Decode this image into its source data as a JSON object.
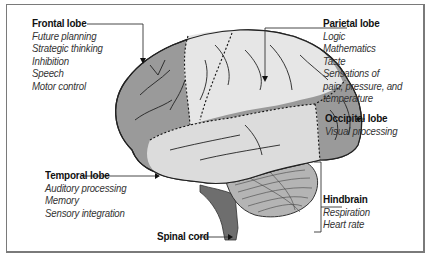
{
  "diagram": {
    "type": "labeled anatomical diagram",
    "regions": [
      {
        "name": "Frontal lobe",
        "functions": [
          "Future planning",
          "Strategic thinking",
          "Inhibition",
          "Speech",
          "Motor control"
        ]
      },
      {
        "name": "Parietal lobe",
        "functions": [
          "Logic",
          "Mathematics",
          "Taste",
          "Sensations of",
          "pain, pressure, and",
          "temperature"
        ]
      },
      {
        "name": "Occipital lobe",
        "functions": [
          "Visual processing"
        ]
      },
      {
        "name": "Temporal lobe",
        "functions": [
          "Auditory processing",
          "Memory",
          "Sensory integration"
        ]
      },
      {
        "name": "Hindbrain",
        "functions": [
          "Respiration",
          "Heart rate"
        ]
      },
      {
        "name": "Spinal cord",
        "functions": []
      }
    ],
    "colors": {
      "frontal": "#9a9a9a",
      "parietal": "#e6e6e6",
      "occipital": "#9a9a9a",
      "temporal": "#dcdcdc",
      "hindbrain": "#b4b4b4",
      "spinal": "#6e6e6e",
      "border": "#7a7a7a"
    }
  }
}
